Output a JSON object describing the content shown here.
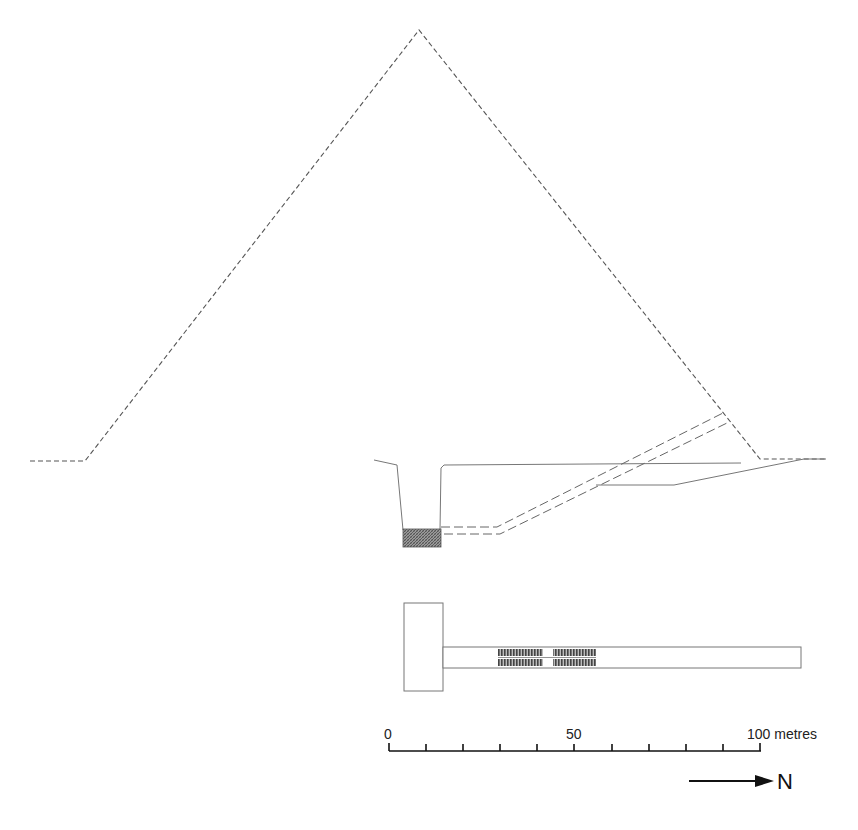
{
  "diagram": {
    "type": "pyramid cross-section and plan",
    "colors": {
      "line": "#777777",
      "dash": "#555555",
      "scale": "#111111",
      "background": "#ffffff"
    },
    "section": {
      "pyramid_outline": "dashed",
      "pit_fill": "hatched"
    },
    "plan": {
      "chamber": "rectangle",
      "passage": "long rectangular corridor",
      "hatched_blocks": 4
    }
  },
  "scale_bar": {
    "label_start": "0",
    "label_mid": "50",
    "label_end": "100 metres",
    "ticks": 11
  },
  "north_arrow": {
    "label": "N",
    "icon": "arrow-right-icon"
  }
}
